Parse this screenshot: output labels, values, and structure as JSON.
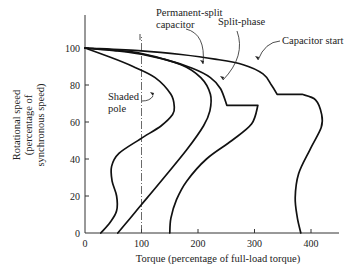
{
  "chart_data": {
    "type": "line",
    "title": "",
    "xlabel": "Torque (percentage of full-load torque)",
    "ylabel": [
      "Rotational speed",
      "(percentage of",
      "synchronous speed)"
    ],
    "xlim": [
      0,
      450
    ],
    "ylim": [
      0,
      120
    ],
    "xticks": [
      0,
      100,
      200,
      300,
      400
    ],
    "yticks": [
      0,
      20,
      40,
      60,
      80,
      100
    ],
    "grid": false,
    "reference_line": {
      "x": 100,
      "style": "dash-dot"
    },
    "series": [
      {
        "name": "Shaded pole",
        "points": [
          [
            28,
            0
          ],
          [
            45,
            6
          ],
          [
            56,
            12
          ],
          [
            56,
            20
          ],
          [
            48,
            28
          ],
          [
            47,
            36
          ],
          [
            60,
            43
          ],
          [
            99,
            51
          ],
          [
            135,
            58
          ],
          [
            155,
            64
          ],
          [
            158,
            68
          ],
          [
            152,
            75
          ],
          [
            124,
            84
          ],
          [
            85,
            90
          ],
          [
            45,
            95
          ],
          [
            0,
            100
          ]
        ]
      },
      {
        "name": "Permanent-split capacitor",
        "points": [
          [
            58,
            0
          ],
          [
            80,
            8
          ],
          [
            99,
            15
          ],
          [
            140,
            30
          ],
          [
            180,
            45
          ],
          [
            210,
            58
          ],
          [
            221,
            66
          ],
          [
            222,
            75
          ],
          [
            205,
            84
          ],
          [
            170,
            91
          ],
          [
            110,
            96
          ],
          [
            55,
            98.5
          ],
          [
            0,
            100
          ]
        ]
      },
      {
        "name": "Split-phase",
        "points": [
          [
            150,
            0
          ],
          [
            152,
            8
          ],
          [
            162,
            18
          ],
          [
            180,
            28
          ],
          [
            215,
            40
          ],
          [
            260,
            50
          ],
          [
            295,
            59
          ],
          [
            306,
            69
          ],
          [
            251,
            69
          ],
          [
            240,
            78
          ],
          [
            222,
            84
          ],
          [
            190,
            89
          ],
          [
            140,
            94
          ],
          [
            80,
            98
          ],
          [
            0,
            100
          ]
        ]
      },
      {
        "name": "Capacitor start",
        "points": [
          [
            382,
            0
          ],
          [
            376,
            8
          ],
          [
            372,
            19
          ],
          [
            378,
            32
          ],
          [
            398,
            45
          ],
          [
            418,
            57
          ],
          [
            419,
            64
          ],
          [
            408,
            72
          ],
          [
            384,
            75
          ],
          [
            340,
            75
          ],
          [
            330,
            80
          ],
          [
            315,
            86
          ],
          [
            280,
            91
          ],
          [
            230,
            94
          ],
          [
            170,
            96.5
          ],
          [
            100,
            98.5
          ],
          [
            0,
            100
          ]
        ]
      }
    ],
    "annotations": [
      {
        "text": [
          "Shaded",
          "pole"
        ],
        "target": "Shaded pole"
      },
      {
        "text": [
          "Permanent-split",
          "capacitor"
        ],
        "target": "Permanent-split capacitor"
      },
      {
        "text": [
          "Split-phase"
        ],
        "target": "Split-phase"
      },
      {
        "text": [
          "Capacitor start"
        ],
        "target": "Capacitor start"
      }
    ]
  }
}
